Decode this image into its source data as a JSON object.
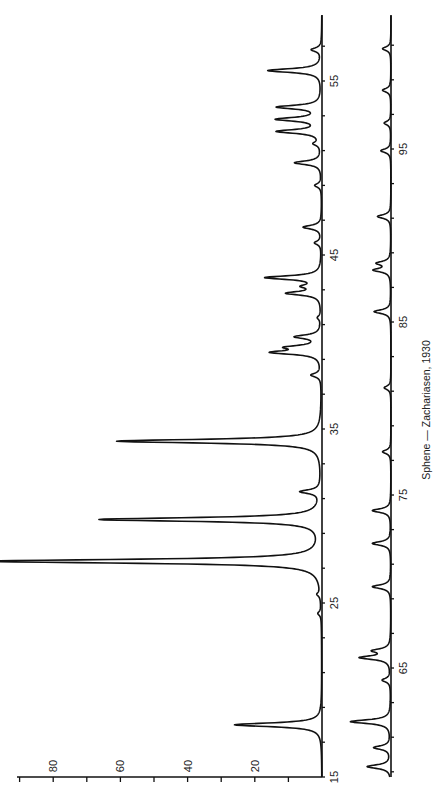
{
  "caption": "Sphene — Zachariasen, 1930",
  "colors": {
    "ink": "#111111",
    "background": "#ffffff"
  },
  "chart_data": {
    "type": "line",
    "title": "Sphene — Zachariasen, 1930",
    "xlabel": "2θ (degrees)",
    "ylabel": "Relative intensity",
    "orientation": "rotated 90° (2θ runs bottom-to-top, intensity grows leftward)",
    "intensity_ticks": [
      "20",
      "40",
      "60",
      "80"
    ],
    "ylim": [
      0,
      100
    ],
    "grid": false,
    "series": [
      {
        "name": "Pattern 15°–58.7°",
        "xlim": [
          15,
          58.8
        ],
        "x_tick_labels": [
          "15",
          "25",
          "35",
          "45",
          "55"
        ],
        "peaks": [
          {
            "two_theta": 18.0,
            "intensity": 26
          },
          {
            "two_theta": 24.4,
            "intensity": 1
          },
          {
            "two_theta": 25.5,
            "intensity": 1
          },
          {
            "two_theta": 27.4,
            "intensity": 100
          },
          {
            "two_theta": 29.8,
            "intensity": 66
          },
          {
            "two_theta": 31.4,
            "intensity": 6
          },
          {
            "two_theta": 34.3,
            "intensity": 61
          },
          {
            "two_theta": 38.1,
            "intensity": 3
          },
          {
            "two_theta": 39.4,
            "intensity": 14
          },
          {
            "two_theta": 39.7,
            "intensity": 9
          },
          {
            "two_theta": 40.3,
            "intensity": 7.5
          },
          {
            "two_theta": 41.4,
            "intensity": 1
          },
          {
            "two_theta": 42.8,
            "intensity": 10
          },
          {
            "two_theta": 43.2,
            "intensity": 4.5
          },
          {
            "two_theta": 43.7,
            "intensity": 16.5
          },
          {
            "two_theta": 45.7,
            "intensity": 2
          },
          {
            "two_theta": 46.6,
            "intensity": 5.5
          },
          {
            "two_theta": 49.0,
            "intensity": 2
          },
          {
            "two_theta": 50.3,
            "intensity": 8
          },
          {
            "two_theta": 51.4,
            "intensity": 2
          },
          {
            "two_theta": 52.1,
            "intensity": 13
          },
          {
            "two_theta": 52.8,
            "intensity": 13
          },
          {
            "two_theta": 53.5,
            "intensity": 13
          },
          {
            "two_theta": 55.6,
            "intensity": 16
          },
          {
            "two_theta": 56.8,
            "intensity": 3
          }
        ]
      },
      {
        "name": "Pattern 58.7°–102.7°",
        "xlim": [
          58.7,
          102.7
        ],
        "x_tick_labels": [
          "65",
          "75",
          "85",
          "95"
        ],
        "peaks": [
          {
            "two_theta": 59.3,
            "intensity": 7
          },
          {
            "two_theta": 60.4,
            "intensity": 5
          },
          {
            "two_theta": 61.9,
            "intensity": 12
          },
          {
            "two_theta": 64.3,
            "intensity": 2.5
          },
          {
            "two_theta": 65.6,
            "intensity": 9
          },
          {
            "two_theta": 66.0,
            "intensity": 5
          },
          {
            "two_theta": 69.7,
            "intensity": 5.5
          },
          {
            "two_theta": 72.2,
            "intensity": 5.5
          },
          {
            "two_theta": 74.1,
            "intensity": 5.5
          },
          {
            "two_theta": 77.5,
            "intensity": 2.5
          },
          {
            "two_theta": 81.2,
            "intensity": 2
          },
          {
            "two_theta": 85.6,
            "intensity": 5
          },
          {
            "two_theta": 88.0,
            "intensity": 5
          },
          {
            "two_theta": 88.4,
            "intensity": 4
          },
          {
            "two_theta": 91.1,
            "intensity": 4
          },
          {
            "two_theta": 94.9,
            "intensity": 3
          },
          {
            "two_theta": 96.5,
            "intensity": 2
          },
          {
            "two_theta": 98.4,
            "intensity": 2.5
          },
          {
            "two_theta": 100.8,
            "intensity": 2.5
          }
        ]
      }
    ]
  }
}
